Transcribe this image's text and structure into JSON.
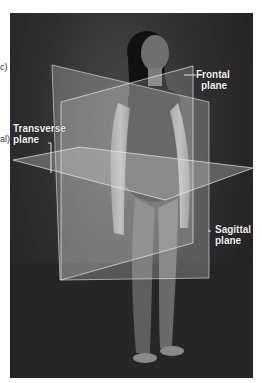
{
  "figure": {
    "labels": {
      "frontal": {
        "line1": "Frontal",
        "line2": "plane"
      },
      "transverse": {
        "line1": "Transverse",
        "line2": "plane"
      },
      "sagittal": {
        "line1": "Sagittal",
        "line2": "plane"
      }
    },
    "clipped_left_text": [
      "c)",
      "al)"
    ],
    "colors": {
      "background": "#2a2a2a",
      "plane_fill": "#cfcfcf",
      "label_text": "#f2f2f2"
    }
  }
}
